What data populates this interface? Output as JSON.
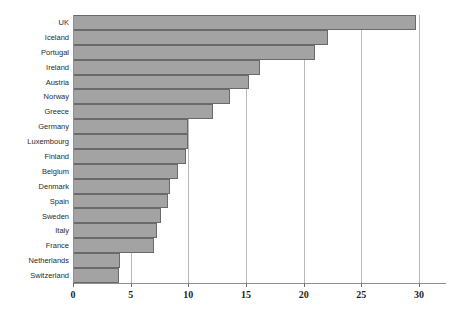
{
  "chart_data": {
    "type": "bar",
    "orientation": "horizontal",
    "title": "",
    "subtitle": "",
    "xlabel": "",
    "ylabel": "",
    "xlim": [
      0,
      30
    ],
    "ylim": null,
    "grid": true,
    "legend": null,
    "legend_position": "none",
    "xticks": [
      0,
      5,
      10,
      15,
      20,
      25,
      30
    ],
    "xtick_labels": [
      "0",
      "5",
      "10",
      "15",
      "20",
      "25",
      "30"
    ],
    "categories": [
      "UK",
      "Iceland",
      "Portugal",
      "Ireland",
      "Austria",
      "Norway",
      "Greece",
      "Germany",
      "Luxembourg",
      "Finland",
      "Belgium",
      "Denmark",
      "Spain",
      "Sweden",
      "Italy",
      "France",
      "Netherlands",
      "Switzerland"
    ],
    "values": [
      29.7,
      22.1,
      21.0,
      16.2,
      15.3,
      13.6,
      12.1,
      10.0,
      10.0,
      9.8,
      9.1,
      8.4,
      8.2,
      7.6,
      7.3,
      7.0,
      4.1,
      4.0
    ],
    "annotations": []
  },
  "style": {
    "bar_fill": "#a3a3a3",
    "bar_border": "#6a6a6a",
    "gridline_color": "#b9b9b9",
    "axis_color": "#8f8f8f",
    "label_color": "#2b2b2b",
    "tick_label_color": "#1f1f1f",
    "background": "#ffffff"
  }
}
